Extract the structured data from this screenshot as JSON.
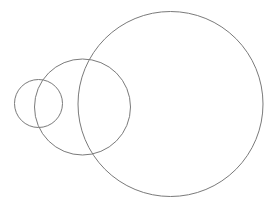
{
  "canvas": {
    "width": 277,
    "height": 209,
    "background_color": "#ffffff",
    "title": "Three overlapping circles"
  },
  "style": {
    "stroke_color": "#7a7a7a",
    "stroke_width": 1,
    "fill": "none"
  },
  "chart_data": {
    "type": "scatter",
    "subtitle": "",
    "xlabel": "",
    "ylabel": "",
    "grid": false,
    "legend": false,
    "xlim": [
      0,
      277
    ],
    "ylim": [
      0,
      209
    ],
    "shapes": [
      {
        "name": "small-circle",
        "shape": "circle",
        "cx": 38.5,
        "cy": 103.5,
        "r": 24,
        "stroke": "#7a7a7a",
        "stroke_width": 1,
        "fill": "none"
      },
      {
        "name": "medium-circle",
        "shape": "circle",
        "cx": 82.5,
        "cy": 107,
        "r": 48,
        "stroke": "#7a7a7a",
        "stroke_width": 1,
        "fill": "none"
      },
      {
        "name": "large-circle",
        "shape": "circle",
        "cx": 170.5,
        "cy": 104,
        "r": 92.5,
        "stroke": "#7a7a7a",
        "stroke_width": 1,
        "fill": "none"
      }
    ]
  }
}
